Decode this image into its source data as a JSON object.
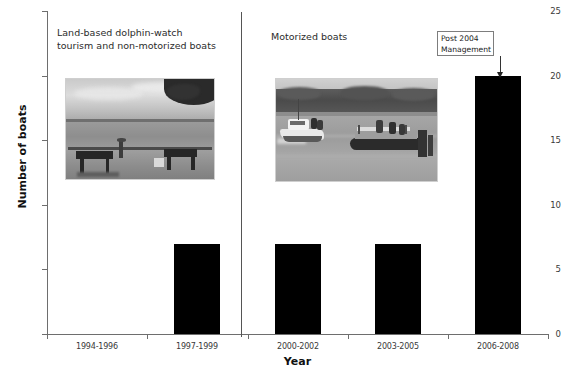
{
  "chart_data": {
    "type": "bar",
    "title": "",
    "subtitle": "",
    "categories": [
      "1994-1996",
      "1997-1999",
      "2000-2002",
      "2003-2005",
      "2006-2008"
    ],
    "values": [
      0,
      7,
      7,
      7,
      20
    ],
    "series": [
      {
        "name": "Number of boats",
        "values": [
          0,
          7,
          7,
          7,
          20
        ]
      }
    ],
    "xlabel": "Year",
    "ylabel": "Number of boats",
    "ylim": [
      0,
      25
    ],
    "yticks": [
      0,
      5,
      10,
      15,
      20,
      25
    ],
    "ytick_labels": [
      "0",
      "5",
      "10",
      "15",
      "20",
      "25"
    ],
    "grid": false,
    "legend": "none",
    "bar_color": "#000000",
    "axis_color": "#6e6e6e",
    "annotations": [
      {
        "name": "group-label-left",
        "text": "Land-based dolphin-watch\ntourism and non-motorized boats",
        "applies_to_categories": [
          "1994-1996",
          "1997-1999"
        ]
      },
      {
        "name": "group-label-right",
        "text": "Motorized boats",
        "applies_to_categories": [
          "2000-2002",
          "2003-2005",
          "2006-2008"
        ]
      },
      {
        "name": "management-callout",
        "text": "Post 2004\nManagement",
        "points_to_category": "2006-2008",
        "arrow": "down"
      },
      {
        "name": "group-divider",
        "text": "",
        "between_categories": [
          "1997-1999",
          "2000-2002"
        ]
      }
    ]
  },
  "annotations": {
    "group_left": "Land-based dolphin-watch\ntourism and non-motorized boats",
    "group_right": "Motorized boats",
    "management_box": "Post 2004\nManagement"
  },
  "axes": {
    "ylabel": "Number of boats",
    "xlabel": "Year"
  },
  "photos": {
    "left": {
      "caption": "land-based dolphin-watch site with benches by the water",
      "alt": "shore-photo"
    },
    "right": {
      "caption": "motorized tour boats on the river",
      "alt": "boats-photo"
    }
  }
}
